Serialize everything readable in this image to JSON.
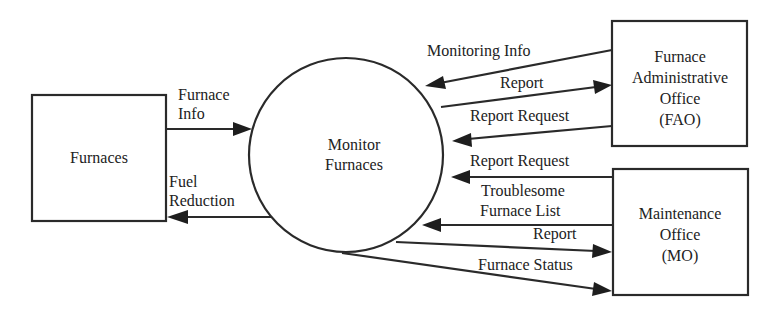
{
  "diagram": {
    "type": "data-flow-diagram",
    "process": {
      "label_lines": [
        "Monitor",
        "Furnaces"
      ]
    },
    "entities": {
      "furnaces": {
        "label_lines": [
          "Furnaces"
        ]
      },
      "fao": {
        "label_lines": [
          "Furnace",
          "Administrative",
          "Office",
          "(FAO)"
        ]
      },
      "mo": {
        "label_lines": [
          "Maintenance",
          "Office",
          "(MO)"
        ]
      }
    },
    "flows": [
      {
        "id": "furnace-info",
        "from": "Furnaces",
        "to": "Monitor Furnaces",
        "label_lines": [
          "Furnace",
          "Info"
        ]
      },
      {
        "id": "fuel-reduction",
        "from": "Monitor Furnaces",
        "to": "Furnaces",
        "label_lines": [
          "Fuel",
          "Reduction"
        ]
      },
      {
        "id": "monitoring-info",
        "from": "FAO",
        "to": "Monitor Furnaces",
        "label_lines": [
          "Monitoring Info"
        ]
      },
      {
        "id": "report-fao",
        "from": "Monitor Furnaces",
        "to": "FAO",
        "label_lines": [
          "Report"
        ]
      },
      {
        "id": "report-request-fao",
        "from": "FAO",
        "to": "Monitor Furnaces",
        "label_lines": [
          "Report Request"
        ]
      },
      {
        "id": "report-request-mo",
        "from": "MO",
        "to": "Monitor Furnaces",
        "label_lines": [
          "Report Request"
        ]
      },
      {
        "id": "troublesome-list",
        "from": "MO",
        "to": "Monitor Furnaces",
        "label_lines": [
          "Troublesome",
          "Furnace List"
        ]
      },
      {
        "id": "report-mo",
        "from": "Monitor Furnaces",
        "to": "MO",
        "label_lines": [
          "Report"
        ]
      },
      {
        "id": "furnace-status",
        "from": "Monitor Furnaces",
        "to": "MO",
        "label_lines": [
          "Furnace Status"
        ]
      }
    ]
  }
}
